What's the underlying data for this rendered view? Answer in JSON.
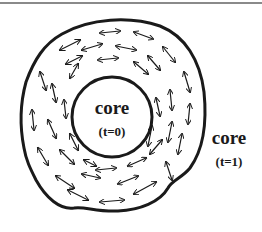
{
  "diagram": {
    "inner_label": {
      "title": "core",
      "subtitle": "(t=0)"
    },
    "outer_label": {
      "title": "core",
      "subtitle": "(t=1)"
    },
    "colors": {
      "stroke": "#1a1a1a",
      "top_rule": "#8a8a8a",
      "background": "#ffffff"
    },
    "arrow_type": "double-headed",
    "arrow_count_approx": 40
  }
}
